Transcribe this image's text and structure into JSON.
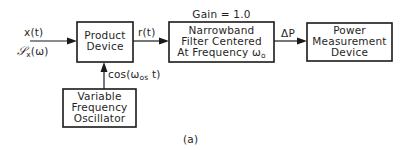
{
  "figure": {
    "caption": "(a)",
    "signals": {
      "input_time": "x(t)",
      "input_spectrum_symbol": "𝒮",
      "input_spectrum_sub": "x",
      "input_spectrum_arg": "(ω)",
      "product_output": "r(t)",
      "oscillator_signal_prefix": "cos(ω",
      "oscillator_signal_sub": "os",
      "oscillator_signal_suffix": " t)",
      "filter_output": "ΔP"
    },
    "filter_gain_label": "Gain = 1.0",
    "blocks": {
      "product_device": {
        "lines": [
          "Product",
          "Device"
        ]
      },
      "narrowband_filter": {
        "lines": [
          "Narrowband",
          "Filter Centered",
          "At Frequency "
        ],
        "freq_symbol": "ω",
        "freq_sub": "o"
      },
      "power_measurement": {
        "lines": [
          "Power",
          "Measurement",
          "Device"
        ]
      },
      "oscillator": {
        "lines": [
          "Variable",
          "Frequency",
          "Oscillator"
        ]
      }
    }
  }
}
